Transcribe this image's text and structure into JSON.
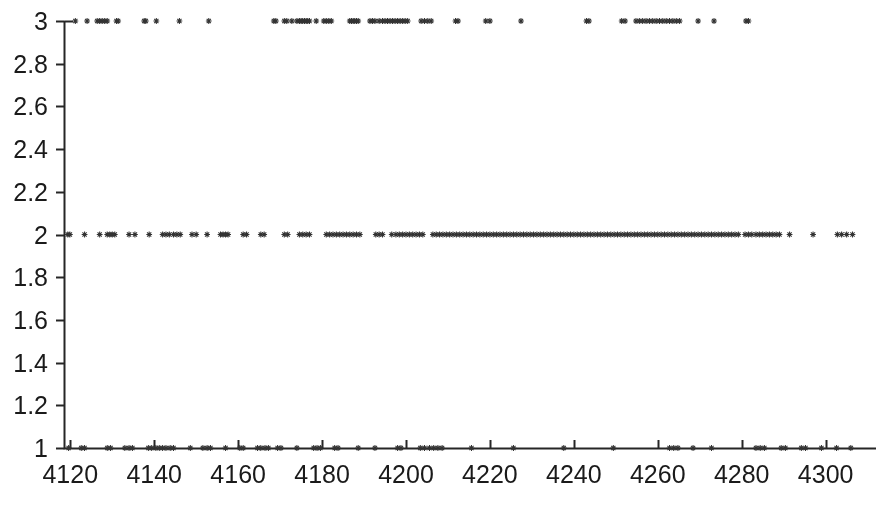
{
  "chart_data": {
    "type": "scatter",
    "title": "",
    "xlabel": "",
    "ylabel": "",
    "xlim": [
      4118.5,
      4312.0
    ],
    "ylim": [
      1,
      3
    ],
    "grid": false,
    "legend": null,
    "marker": "asterisk-point",
    "marker_color": "#333333",
    "axis_color": "#262626",
    "xticks": [
      4120,
      4140,
      4160,
      4180,
      4200,
      4220,
      4240,
      4260,
      4280,
      4300
    ],
    "xtick_labels": [
      "4120",
      "4140",
      "4160",
      "4180",
      "4200",
      "4220",
      "4240",
      "4260",
      "4280",
      "4300"
    ],
    "yticks": [
      1,
      1.2,
      1.4,
      1.6,
      1.8,
      2,
      2.2,
      2.4,
      2.6,
      2.8,
      3
    ],
    "ytick_labels": [
      "1",
      "1.2",
      "1.4",
      "1.6",
      "1.8",
      "2",
      "2.2",
      "2.4",
      "2.6",
      "2.8",
      "3"
    ],
    "series": [
      {
        "name": "level-3",
        "y": 3,
        "x": [
          4121.2,
          4124.0,
          4126.4,
          4127.0,
          4127.6,
          4128.2,
          4128.8,
          4131.0,
          4131.4,
          4137.6,
          4138.0,
          4140.5,
          4146.0,
          4153.0,
          4168.5,
          4169.0,
          4171.0,
          4171.6,
          4172.8,
          4174.0,
          4174.6,
          4175.0,
          4175.4,
          4175.8,
          4176.2,
          4176.6,
          4177.0,
          4178.6,
          4180.4,
          4181.0,
          4181.6,
          4182.2,
          4186.6,
          4187.0,
          4187.4,
          4187.8,
          4188.2,
          4188.6,
          4191.4,
          4192.0,
          4192.6,
          4193.6,
          4194.4,
          4195.0,
          4195.6,
          4196.2,
          4196.8,
          4197.4,
          4198.0,
          4198.6,
          4199.2,
          4199.8,
          4200.4,
          4203.6,
          4204.4,
          4205.2,
          4206.0,
          4211.8,
          4212.4,
          4219.0,
          4220.0,
          4227.4,
          4243.0,
          4243.6,
          4251.4,
          4252.2,
          4254.8,
          4255.6,
          4256.4,
          4257.2,
          4258.0,
          4258.8,
          4259.6,
          4260.4,
          4261.2,
          4262.0,
          4262.8,
          4263.6,
          4264.4,
          4265.2,
          4269.6,
          4273.4,
          4281.0,
          4281.6
        ]
      },
      {
        "name": "level-2",
        "y": 2,
        "x": [
          4119.4,
          4119.9,
          4123.4,
          4127.0,
          4128.8,
          4129.4,
          4130.0,
          4130.6,
          4134.0,
          4135.4,
          4138.8,
          4142.0,
          4142.8,
          4143.6,
          4144.6,
          4145.4,
          4146.2,
          4149.0,
          4150.0,
          4152.6,
          4155.8,
          4156.4,
          4157.0,
          4157.6,
          4161.2,
          4162.0,
          4165.4,
          4166.2,
          4171.0,
          4171.8,
          4174.6,
          4175.4,
          4176.2,
          4177.0,
          4181.0,
          4181.8,
          4182.6,
          4183.4,
          4184.2,
          4185.0,
          4185.8,
          4186.6,
          4187.4,
          4188.2,
          4189.0,
          4192.8,
          4193.6,
          4194.4,
          4196.6,
          4197.6,
          4198.4,
          4199.2,
          4200.0,
          4200.8,
          4201.6,
          4202.4,
          4203.2,
          4204.0,
          4206.4,
          4207.2,
          4208.0,
          4208.8,
          4209.6,
          4210.4,
          4211.2,
          4212.0,
          4212.8,
          4213.6,
          4214.4,
          4215.2,
          4216.0,
          4216.8,
          4217.6,
          4218.4,
          4219.2,
          4220.0,
          4220.8,
          4221.6,
          4222.4,
          4223.2,
          4224.0,
          4224.8,
          4225.6,
          4226.4,
          4227.2,
          4228.0,
          4228.8,
          4229.6,
          4230.4,
          4231.2,
          4232.0,
          4232.8,
          4233.6,
          4234.4,
          4235.2,
          4236.0,
          4236.8,
          4237.6,
          4238.4,
          4239.2,
          4240.0,
          4240.8,
          4241.6,
          4242.4,
          4243.2,
          4244.0,
          4244.8,
          4245.6,
          4246.4,
          4247.2,
          4248.0,
          4248.8,
          4249.6,
          4250.4,
          4251.2,
          4252.0,
          4252.8,
          4253.6,
          4254.4,
          4255.2,
          4256.0,
          4256.8,
          4257.6,
          4258.4,
          4259.2,
          4260.0,
          4260.8,
          4261.6,
          4262.4,
          4263.2,
          4264.0,
          4264.8,
          4265.6,
          4266.4,
          4267.2,
          4268.0,
          4268.8,
          4269.6,
          4270.4,
          4271.2,
          4272.0,
          4272.8,
          4273.6,
          4274.4,
          4275.2,
          4276.0,
          4276.8,
          4277.6,
          4278.4,
          4279.2,
          4280.8,
          4281.6,
          4282.4,
          4283.4,
          4284.2,
          4285.0,
          4285.8,
          4286.6,
          4287.4,
          4288.2,
          4289.0,
          4291.4,
          4297.0,
          4302.8,
          4303.8,
          4305.0,
          4306.4
        ]
      },
      {
        "name": "level-1",
        "y": 1,
        "x": [
          4119.6,
          4122.6,
          4123.4,
          4128.8,
          4129.6,
          4133.0,
          4134.0,
          4134.8,
          4138.6,
          4139.4,
          4140.4,
          4141.2,
          4142.0,
          4142.8,
          4143.8,
          4144.6,
          4148.6,
          4151.6,
          4152.6,
          4153.4,
          4157.0,
          4160.4,
          4161.2,
          4164.6,
          4165.4,
          4166.4,
          4167.2,
          4169.4,
          4170.2,
          4174.0,
          4178.0,
          4178.8,
          4179.6,
          4183.0,
          4183.8,
          4188.6,
          4192.6,
          4198.0,
          4198.8,
          4203.4,
          4204.4,
          4205.6,
          4206.6,
          4207.6,
          4208.6,
          4215.6,
          4225.6,
          4237.6,
          4249.4,
          4262.8,
          4263.8,
          4264.8,
          4268.4,
          4272.8,
          4283.4,
          4284.4,
          4285.4,
          4289.4,
          4290.4,
          4294.2,
          4295.2,
          4299.0,
          4302.6,
          4306.0
        ]
      }
    ]
  }
}
